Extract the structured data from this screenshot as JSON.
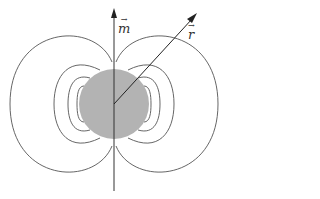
{
  "diagram": {
    "labels": {
      "moment": "m",
      "position": "r",
      "vector_mark": "→"
    },
    "colors": {
      "sphere": "#b3b3b3",
      "field_line": "#555555",
      "axis": "#333333",
      "background": "#ffffff"
    },
    "sphere": {
      "cx": 114,
      "cy": 104,
      "r": 35
    },
    "axis": {
      "x": 114,
      "y_top": 8,
      "y_bottom": 191
    },
    "position_vector": {
      "x1": 114,
      "y1": 104,
      "x2": 196,
      "y2": 14
    },
    "field_line_loops": [
      {
        "side": "both",
        "extent_x": 104,
        "half_height": 70
      },
      {
        "side": "both",
        "extent_x": 60,
        "half_height": 38
      },
      {
        "side": "both",
        "extent_x": 46,
        "half_height": 25
      },
      {
        "side": "both",
        "extent_x": 37,
        "half_height": 18
      }
    ]
  }
}
